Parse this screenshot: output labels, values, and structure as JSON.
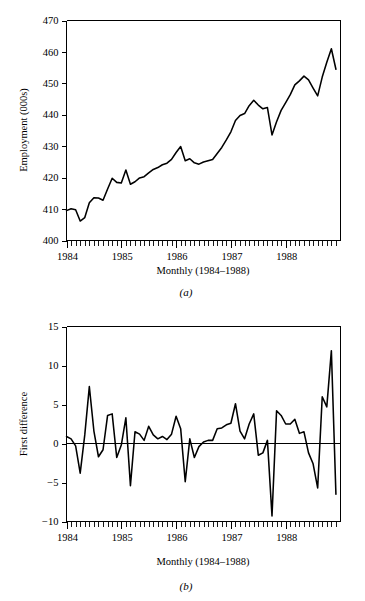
{
  "figure": {
    "panels": [
      {
        "id": "a",
        "caption": "(a)",
        "xlabel": "Monthly (1984–1988)",
        "ylabel": "Employment (000s)"
      },
      {
        "id": "b",
        "caption": "(b)",
        "xlabel": "Monthly (1984–1988)",
        "ylabel": "First difference"
      }
    ]
  },
  "chart_data": [
    {
      "type": "line",
      "panel": "a",
      "title": "",
      "xlabel": "Monthly (1984–1988)",
      "ylabel": "Employment (000s)",
      "xlim": [
        0,
        60
      ],
      "ylim": [
        400,
        470
      ],
      "yticks": [
        400,
        410,
        420,
        430,
        440,
        450,
        460,
        470
      ],
      "ytick_labels": [
        "400",
        "410",
        "420",
        "430",
        "440",
        "450",
        "460",
        "470"
      ],
      "xtick_labels": [
        "1984",
        "1985",
        "1986",
        "1987",
        "1988"
      ],
      "xtick_positions": [
        0,
        12,
        24,
        36,
        48
      ],
      "x_minor_ticks": 60,
      "grid": false,
      "legend": null,
      "series": [
        {
          "name": "Employment (000s)",
          "x": [
            0,
            1,
            2,
            3,
            4,
            5,
            6,
            7,
            8,
            9,
            10,
            11,
            12,
            13,
            14,
            15,
            16,
            17,
            18,
            19,
            20,
            21,
            22,
            23,
            24,
            25,
            26,
            27,
            28,
            29,
            30,
            31,
            32,
            33,
            34,
            35,
            36,
            37,
            38,
            39,
            40,
            41,
            42,
            43,
            44,
            45,
            46,
            47,
            48,
            49,
            50,
            51,
            52,
            53,
            54,
            55,
            56,
            57,
            58,
            59
          ],
          "values": [
            409.5,
            410.1,
            409.8,
            406.2,
            407.3,
            412.0,
            413.6,
            413.5,
            412.8,
            416.4,
            419.8,
            418.5,
            418.3,
            422.4,
            417.9,
            418.7,
            419.9,
            420.3,
            421.5,
            422.6,
            423.2,
            424.1,
            424.6,
            425.8,
            428.0,
            429.9,
            425.4,
            426.0,
            424.7,
            424.3,
            425.0,
            425.4,
            425.8,
            427.7,
            429.6,
            432.0,
            434.6,
            438.2,
            439.8,
            440.4,
            442.9,
            444.6,
            443.1,
            441.9,
            442.3,
            433.6,
            437.8,
            441.4,
            443.9,
            446.4,
            449.5,
            450.8,
            452.3,
            451.1,
            448.5,
            446.0,
            452.0,
            456.7,
            461.0,
            454.5
          ]
        }
      ]
    },
    {
      "type": "line",
      "panel": "b",
      "title": "",
      "xlabel": "Monthly (1984–1988)",
      "ylabel": "First difference",
      "xlim": [
        0,
        60
      ],
      "ylim": [
        -10,
        15
      ],
      "yticks": [
        -10,
        -5,
        0,
        5,
        10,
        15
      ],
      "ytick_labels": [
        "−10",
        "−5",
        "0",
        "5",
        "10",
        "15"
      ],
      "xtick_labels": [
        "1984",
        "1985",
        "1986",
        "1987",
        "1988"
      ],
      "xtick_positions": [
        0,
        12,
        24,
        36,
        48
      ],
      "x_minor_ticks": 60,
      "grid": false,
      "reference_line": 0,
      "legend": null,
      "series": [
        {
          "name": "First difference",
          "x": [
            0,
            1,
            2,
            3,
            4,
            5,
            6,
            7,
            8,
            9,
            10,
            11,
            12,
            13,
            14,
            15,
            16,
            17,
            18,
            19,
            20,
            21,
            22,
            23,
            24,
            25,
            26,
            27,
            28,
            29,
            30,
            31,
            32,
            33,
            34,
            35,
            36,
            37,
            38,
            39,
            40,
            41,
            42,
            43,
            44,
            45,
            46,
            47,
            48,
            49,
            50,
            51,
            52,
            53,
            54,
            55,
            56,
            57,
            58,
            59
          ],
          "values": [
            0.9,
            0.6,
            -0.3,
            -3.8,
            1.1,
            7.3,
            1.6,
            -1.7,
            -0.8,
            3.6,
            3.8,
            -1.8,
            -0.2,
            3.3,
            -5.4,
            1.5,
            1.2,
            0.4,
            2.2,
            1.1,
            0.6,
            0.9,
            0.5,
            1.2,
            3.5,
            1.9,
            -4.9,
            0.6,
            -1.8,
            -0.4,
            0.2,
            0.4,
            0.4,
            1.9,
            2.0,
            2.4,
            2.6,
            5.1,
            1.6,
            0.6,
            2.5,
            3.8,
            -1.5,
            -1.2,
            0.4,
            -9.3,
            4.2,
            3.6,
            2.5,
            2.5,
            3.1,
            1.3,
            1.5,
            -1.2,
            -2.6,
            -5.7,
            6.0,
            4.7,
            11.9,
            -6.5
          ]
        }
      ]
    }
  ]
}
